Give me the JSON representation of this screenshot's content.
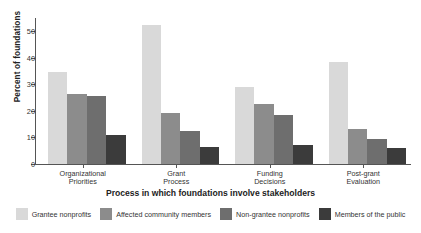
{
  "chart_data": {
    "type": "bar",
    "title": "",
    "xlabel": "Process in which foundations involve stakeholders",
    "ylabel": "Percent of foundations",
    "categories": [
      "Organizational\nPriorities",
      "Grant\nProcess",
      "Funding\nDecisions",
      "Post-grant\nEvaluation"
    ],
    "category_lines": [
      [
        "Organizational",
        "Priorities"
      ],
      [
        "Grant",
        "Process"
      ],
      [
        "Funding",
        "Decisions"
      ],
      [
        "Post-grant",
        "Evaluation"
      ]
    ],
    "series": [
      {
        "name": "Grantee nonprofits",
        "color": "#d9d9d9",
        "values": [
          34.5,
          52.5,
          29.0,
          38.6
        ]
      },
      {
        "name": "Affected community members",
        "color": "#8c8c8c",
        "values": [
          26.3,
          19.4,
          22.5,
          13.1
        ]
      },
      {
        "name": "Non-grantee nonprofits",
        "color": "#6e6e6e",
        "values": [
          25.8,
          12.6,
          18.3,
          9.3
        ]
      },
      {
        "name": "Members of the public",
        "color": "#3b3b3b",
        "values": [
          11.0,
          6.4,
          7.0,
          6.1
        ]
      }
    ],
    "ylim": [
      0,
      55
    ],
    "yticks": [
      0,
      10,
      20,
      30,
      40,
      50
    ],
    "ytick_labels": [
      "0",
      "10",
      "20",
      "30",
      "40",
      "50"
    ],
    "grid": false,
    "legend_position": "bottom",
    "axis_color": "#555555",
    "background_color": "#ffffff"
  }
}
